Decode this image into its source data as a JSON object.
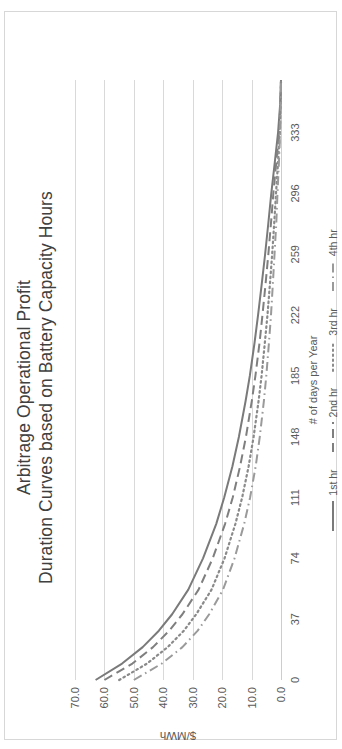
{
  "chart_data": {
    "type": "line",
    "title": "Arbitrage Operational Profit",
    "subtitle": "Duration Curves based on Battery Capacity Hours",
    "xlabel": "# of days per Year",
    "ylabel": "$/MWh",
    "xlim": [
      0,
      365
    ],
    "ylim": [
      0,
      70
    ],
    "xticks": [
      "0",
      "37",
      "74",
      "111",
      "148",
      "185",
      "222",
      "259",
      "296",
      "333"
    ],
    "xtick_values": [
      0,
      37,
      74,
      111,
      148,
      185,
      222,
      259,
      296,
      333
    ],
    "yticks": [
      "0.0",
      "10.0",
      "20.0",
      "30.0",
      "40.0",
      "50.0",
      "60.0",
      "70.0"
    ],
    "ytick_values": [
      0,
      10,
      20,
      30,
      40,
      50,
      60,
      70
    ],
    "grid": "horizontal",
    "legend_position": "bottom",
    "orientation": "rotated-90-ccw",
    "x": [
      0,
      10,
      20,
      30,
      40,
      55,
      74,
      95,
      111,
      130,
      148,
      170,
      185,
      205,
      222,
      240,
      259,
      278,
      296,
      315,
      333,
      350,
      365
    ],
    "series": [
      {
        "name": "1st hr",
        "style": "solid",
        "color": "#7a7a7a",
        "values": [
          63.0,
          54.0,
          47.0,
          41.5,
          37.0,
          31.5,
          26.5,
          22.0,
          19.3,
          16.5,
          14.3,
          12.0,
          10.6,
          9.0,
          7.8,
          6.6,
          5.4,
          4.3,
          3.3,
          2.1,
          1.0,
          0.3,
          0.0
        ]
      },
      {
        "name": "2nd hr",
        "style": "dashed",
        "color": "#7f7f7f",
        "values": [
          60.0,
          50.5,
          43.5,
          38.0,
          33.5,
          28.0,
          23.2,
          19.0,
          16.4,
          13.9,
          11.9,
          9.9,
          8.7,
          7.3,
          6.3,
          5.3,
          4.3,
          3.4,
          2.6,
          1.6,
          0.7,
          0.2,
          0.0
        ]
      },
      {
        "name": "3rd hr",
        "style": "dotted",
        "color": "#8a8a8a",
        "values": [
          55.0,
          45.5,
          38.5,
          33.0,
          28.8,
          23.6,
          19.2,
          15.5,
          13.2,
          11.0,
          9.3,
          7.6,
          6.6,
          5.5,
          4.6,
          3.8,
          3.0,
          2.3,
          1.7,
          1.0,
          0.4,
          0.1,
          0.0
        ]
      },
      {
        "name": "4th hr",
        "style": "dashdot",
        "color": "#9a9a9a",
        "values": [
          50.0,
          40.5,
          33.5,
          28.3,
          24.4,
          19.7,
          15.8,
          12.5,
          10.5,
          8.6,
          7.2,
          5.8,
          5.0,
          4.1,
          3.4,
          2.8,
          2.2,
          1.6,
          1.2,
          0.7,
          0.3,
          0.1,
          0.0
        ]
      }
    ]
  },
  "legend": {
    "items": [
      {
        "label": "1st hr"
      },
      {
        "label": "2nd hr"
      },
      {
        "label": "3rd hr"
      },
      {
        "label": "4th hr"
      }
    ]
  }
}
